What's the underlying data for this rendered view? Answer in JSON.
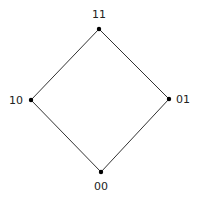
{
  "diagram": {
    "type": "hasse-diagram",
    "nodes": [
      {
        "id": "11",
        "label": "11",
        "x": 99,
        "y": 29,
        "lx": 99,
        "ly": 18
      },
      {
        "id": "10",
        "label": "10",
        "x": 31,
        "y": 100,
        "lx": 16,
        "ly": 104
      },
      {
        "id": "01",
        "label": "01",
        "x": 169,
        "y": 99,
        "lx": 183,
        "ly": 103
      },
      {
        "id": "00",
        "label": "00",
        "x": 101,
        "y": 172,
        "lx": 101,
        "ly": 190
      }
    ],
    "edges": [
      [
        "11",
        "10"
      ],
      [
        "11",
        "01"
      ],
      [
        "10",
        "00"
      ],
      [
        "01",
        "00"
      ]
    ],
    "colors": {
      "line": "#333333",
      "node": "#000000",
      "text": "#222222"
    }
  }
}
